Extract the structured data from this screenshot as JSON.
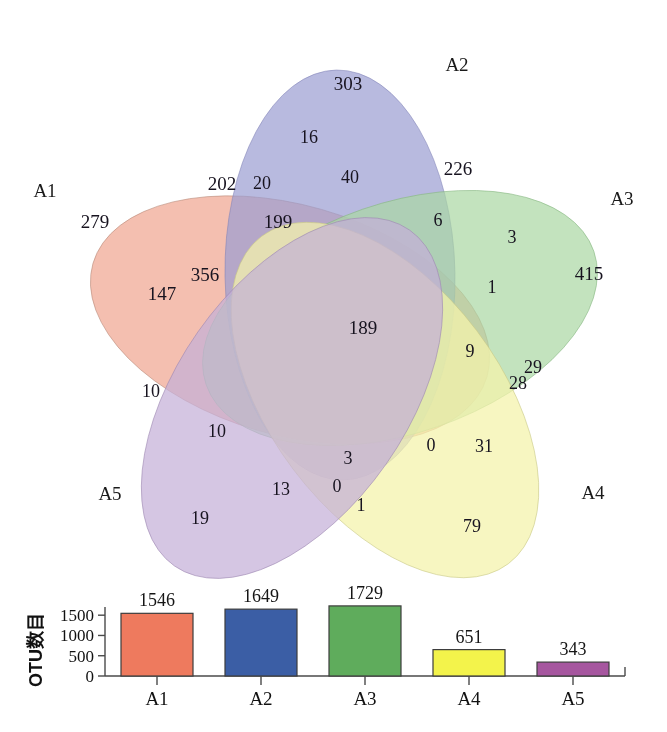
{
  "figure": {
    "type": "venn-diagram-with-barchart",
    "background_color": "#ffffff"
  },
  "venn": {
    "set_labels": [
      {
        "name": "A1",
        "color": "#e8a591"
      },
      {
        "name": "A2",
        "color": "#9b9cd0"
      },
      {
        "name": "A3",
        "color": "#a8d5a2"
      },
      {
        "name": "A4",
        "color": "#f2f2a8"
      },
      {
        "name": "A5",
        "color": "#c4aed4"
      }
    ],
    "labels": {
      "a1": "A1",
      "a2": "A2",
      "a3": "A3",
      "a4": "A4",
      "a5": "A5"
    },
    "counts": {
      "a1_only": "279",
      "a2_only": "303",
      "a3_only": "415",
      "a4_only": "79",
      "a5_only": "19",
      "a1_a2": "202",
      "a2_a3": "226",
      "a3_a4": "29",
      "a4_a5": "1",
      "a1_a5": "10",
      "a1_a2_a3": "40",
      "a2_a3_a4": "3",
      "a3_a4_a5": "0",
      "a1_a4_a5": "0",
      "a1_a2_a5": "356",
      "a1_a2_a4": "199",
      "a2_a3_a5": "6",
      "a2_a4_a5": "13",
      "a1_a3_a4": "31",
      "a1_a3_a5": "10",
      "a1_a2_a3_a4": "9",
      "a2_a3_a4_a5": "1",
      "a1_a3_a4_a5": "28",
      "a1_a2_a4_a5": "3",
      "a1_a2_a3_a5": "20",
      "all_five": "189",
      "a2_only_sub": "16",
      "a1_sub": "147"
    },
    "region_values": [
      {
        "id": "a1_only",
        "value": "279",
        "x": 95,
        "y": 228
      },
      {
        "id": "a2_only",
        "value": "303",
        "x": 348,
        "y": 90
      },
      {
        "id": "a3_only",
        "value": "415",
        "x": 589,
        "y": 280
      },
      {
        "id": "a4_only",
        "value": "79",
        "x": 472,
        "y": 532
      },
      {
        "id": "a5_only",
        "value": "19",
        "x": 200,
        "y": 524
      },
      {
        "id": "r16",
        "value": "16",
        "x": 309,
        "y": 143
      },
      {
        "id": "r202",
        "value": "202",
        "x": 222,
        "y": 190
      },
      {
        "id": "r20",
        "value": "20",
        "x": 262,
        "y": 189
      },
      {
        "id": "r40",
        "value": "40",
        "x": 350,
        "y": 183
      },
      {
        "id": "r226",
        "value": "226",
        "x": 458,
        "y": 175
      },
      {
        "id": "r199",
        "value": "199",
        "x": 278,
        "y": 228
      },
      {
        "id": "r6",
        "value": "6",
        "x": 438,
        "y": 226
      },
      {
        "id": "r3_right",
        "value": "3",
        "x": 512,
        "y": 243
      },
      {
        "id": "r356",
        "value": "356",
        "x": 205,
        "y": 281
      },
      {
        "id": "r147",
        "value": "147",
        "x": 162,
        "y": 300
      },
      {
        "id": "r1_right",
        "value": "1",
        "x": 492,
        "y": 293
      },
      {
        "id": "r189",
        "value": "189",
        "x": 363,
        "y": 334
      },
      {
        "id": "r9",
        "value": "9",
        "x": 470,
        "y": 357
      },
      {
        "id": "r29",
        "value": "29",
        "x": 533,
        "y": 373
      },
      {
        "id": "r28",
        "value": "28",
        "x": 518,
        "y": 389
      },
      {
        "id": "r10_left",
        "value": "10",
        "x": 151,
        "y": 397
      },
      {
        "id": "r10_mid",
        "value": "10",
        "x": 217,
        "y": 437
      },
      {
        "id": "r0_right",
        "value": "0",
        "x": 431,
        "y": 451
      },
      {
        "id": "r31",
        "value": "31",
        "x": 484,
        "y": 452
      },
      {
        "id": "r3_bot",
        "value": "3",
        "x": 348,
        "y": 464
      },
      {
        "id": "r13",
        "value": "13",
        "x": 281,
        "y": 495
      },
      {
        "id": "r0_bot",
        "value": "0",
        "x": 337,
        "y": 492
      },
      {
        "id": "r1_bot",
        "value": "1",
        "x": 361,
        "y": 511
      }
    ]
  },
  "chart_data": {
    "type": "bar",
    "title": "",
    "xlabel": "",
    "ylabel": "OTU数目",
    "categories": [
      "A1",
      "A2",
      "A3",
      "A4",
      "A5"
    ],
    "values": [
      1546,
      1649,
      1729,
      651,
      343
    ],
    "value_labels": [
      "1546",
      "1649",
      "1729",
      "651",
      "343"
    ],
    "colors": [
      "#EE7A5E",
      "#3B5EA5",
      "#5FAC5C",
      "#F3F34B",
      "#A6569F"
    ],
    "ytick_labels": [
      "0",
      "500",
      "1000",
      "1500"
    ],
    "yticks": [
      0,
      500,
      1000,
      1500
    ],
    "ylim": [
      0,
      1850
    ],
    "grid": false,
    "legend": false
  }
}
